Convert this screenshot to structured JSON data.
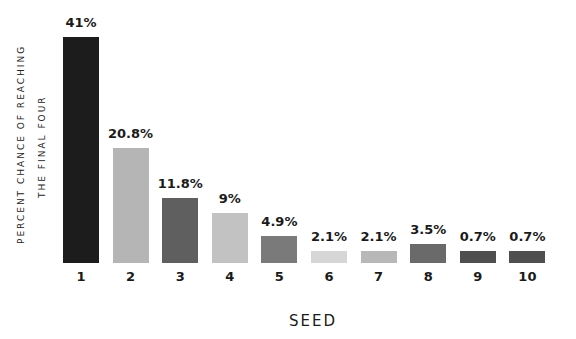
{
  "chart_data": {
    "type": "bar",
    "title": "",
    "xlabel": "SEED",
    "ylabel": "PERCENT CHANCE OF REACHING THE FINAL FOUR",
    "ylabel_lines": [
      "PERCENT CHANCE OF REACHING",
      "THE FINAL FOUR"
    ],
    "categories": [
      "1",
      "2",
      "3",
      "4",
      "5",
      "6",
      "7",
      "8",
      "9",
      "10"
    ],
    "values": [
      41,
      20.8,
      11.8,
      9,
      4.9,
      2.1,
      2.1,
      3.5,
      0.7,
      0.7
    ],
    "value_labels": [
      "41%",
      "20.8%",
      "11.8%",
      "9%",
      "4.9%",
      "2.1%",
      "2.1%",
      "3.5%",
      "0.7%",
      "0.7%"
    ],
    "colors": [
      "#1c1c1c",
      "#b5b5b5",
      "#5f5f5f",
      "#c2c2c2",
      "#7a7a7a",
      "#d6d6d6",
      "#b8b8b8",
      "#6a6a6a",
      "#4f4f4f",
      "#4f4f4f"
    ],
    "grid": false,
    "legend": null
  }
}
